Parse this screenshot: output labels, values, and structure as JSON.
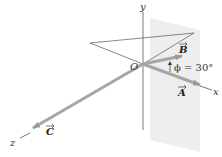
{
  "diagram": {
    "axes": {
      "x": "x",
      "y": "y",
      "z": "z"
    },
    "origin_label": "O",
    "vectors": [
      {
        "name": "A",
        "label": "A"
      },
      {
        "name": "B",
        "label": "B"
      },
      {
        "name": "C",
        "label": "C"
      }
    ],
    "angle_label": "ϕ = 30°",
    "colors": {
      "vector": "#a6a6a6",
      "axis": "#555555",
      "plane": "#ececec"
    }
  }
}
